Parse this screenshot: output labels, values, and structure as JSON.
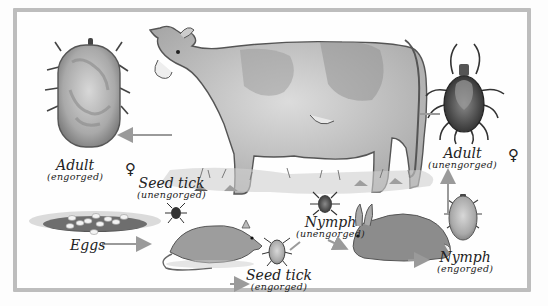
{
  "diagram": {
    "colors": {
      "frame": "#bdbdbd",
      "arrow": "#9a9a9a",
      "text": "#222222"
    },
    "stages": [
      {
        "id": "adult-engorged",
        "label": "Adult",
        "sublabel": "(engorged)",
        "symbol": "♀"
      },
      {
        "id": "seed-tick-unengorged",
        "label": "Seed tick",
        "sublabel": "(unengorged)"
      },
      {
        "id": "eggs",
        "label": "Eggs"
      },
      {
        "id": "seed-tick-engorged",
        "label": "Seed tick",
        "sublabel": "(engorged)"
      },
      {
        "id": "nymph-unengorged",
        "label": "Nymph",
        "sublabel": "(unengorged)"
      },
      {
        "id": "nymph-engorged",
        "label": "Nymph",
        "sublabel": "(engorged)"
      },
      {
        "id": "adult-unengorged",
        "label": "Adult",
        "sublabel": "(unengorged)",
        "symbol": "♀"
      }
    ],
    "hosts": [
      "cow",
      "mouse",
      "rabbit"
    ]
  }
}
